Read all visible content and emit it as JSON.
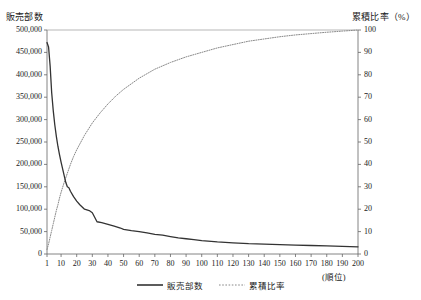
{
  "chart_data": {
    "type": "line",
    "title": "",
    "xlabel": "(順位)",
    "ylabel": "販売部数",
    "y2label": "累積比率（%）",
    "grid": false,
    "legend_position": "bottom",
    "xlim": [
      1,
      200
    ],
    "ylim": [
      0,
      500000
    ],
    "y2lim": [
      0,
      100
    ],
    "x_ticks": [
      1,
      10,
      20,
      30,
      40,
      50,
      60,
      70,
      80,
      90,
      100,
      110,
      120,
      130,
      140,
      150,
      160,
      170,
      180,
      190,
      200
    ],
    "y_ticks": [
      0,
      50000,
      100000,
      150000,
      200000,
      250000,
      300000,
      350000,
      400000,
      450000,
      500000
    ],
    "y_tick_labels": [
      "0",
      "50,000",
      "100,000",
      "150,000",
      "200,000",
      "250,000",
      "300,000",
      "350,000",
      "400,000",
      "450,000",
      "500,000"
    ],
    "y2_ticks": [
      0,
      10,
      20,
      30,
      40,
      50,
      60,
      70,
      80,
      90,
      100
    ],
    "y2_tick_labels": [
      "0",
      "10",
      "20",
      "30",
      "40",
      "50",
      "60",
      "70",
      "80",
      "90",
      "100"
    ],
    "series": [
      {
        "name": "販売部数",
        "axis": "left",
        "style": "solid",
        "color": "#333333",
        "x": [
          1,
          2,
          3,
          4,
          5,
          6,
          7,
          8,
          9,
          10,
          11,
          12,
          13,
          14,
          15,
          16,
          18,
          20,
          22,
          25,
          28,
          30,
          33,
          36,
          40,
          44,
          48,
          50,
          55,
          60,
          65,
          70,
          75,
          80,
          85,
          90,
          95,
          100,
          110,
          120,
          130,
          140,
          150,
          160,
          170,
          180,
          190,
          200
        ],
        "values": [
          472000,
          462000,
          420000,
          360000,
          320000,
          288000,
          262000,
          240000,
          222000,
          205000,
          190000,
          175000,
          160000,
          150000,
          148000,
          140000,
          128000,
          118000,
          110000,
          100000,
          97000,
          92000,
          72000,
          70000,
          66000,
          62000,
          58000,
          55000,
          52000,
          50000,
          47000,
          44000,
          42000,
          39000,
          36000,
          34000,
          32000,
          30000,
          27000,
          25000,
          23000,
          22000,
          21000,
          20000,
          19000,
          18000,
          17000,
          16000
        ]
      },
      {
        "name": "累積比率",
        "axis": "right",
        "style": "dotted",
        "color": "#888888",
        "x": [
          1,
          2,
          3,
          4,
          5,
          6,
          7,
          8,
          9,
          10,
          12,
          14,
          16,
          18,
          20,
          25,
          30,
          35,
          40,
          45,
          50,
          55,
          60,
          70,
          80,
          90,
          100,
          110,
          120,
          130,
          140,
          150,
          160,
          170,
          180,
          190,
          200
        ],
        "values": [
          2.0,
          4.5,
          7.5,
          10.5,
          13.5,
          16.5,
          19.5,
          22.0,
          25.0,
          27.5,
          32.0,
          36.0,
          40.0,
          43.5,
          46.5,
          53.0,
          58.5,
          63.0,
          67.0,
          70.5,
          73.5,
          76.0,
          78.5,
          82.5,
          85.5,
          88.0,
          90.0,
          92.0,
          93.5,
          95.0,
          96.0,
          97.0,
          97.8,
          98.4,
          99.0,
          99.5,
          100.0
        ]
      }
    ],
    "legend": [
      {
        "label": "販売部数",
        "style": "solid",
        "color": "#333333"
      },
      {
        "label": "累積比率",
        "style": "dotted",
        "color": "#888888"
      }
    ]
  }
}
